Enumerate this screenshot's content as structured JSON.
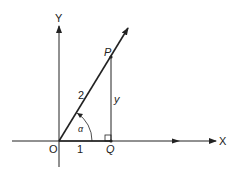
{
  "diagram": {
    "axes": {
      "x_label": "X",
      "y_label": "Y",
      "origin_label": "O"
    },
    "points": {
      "P": "P",
      "Q": "Q"
    },
    "segments": {
      "OP_length": "2",
      "OQ_length": "1",
      "PQ_length": "y"
    },
    "angle": {
      "label": "α"
    },
    "colors": {
      "stroke": "#222222",
      "background": "#ffffff"
    }
  }
}
